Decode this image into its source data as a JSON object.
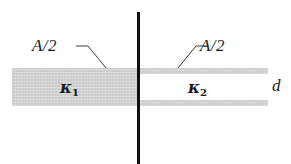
{
  "figure": {
    "labels": {
      "area_left": "A/2",
      "area_right": "A/2",
      "thickness": "d",
      "kappa_left_symbol": "κ",
      "kappa_left_index": "1",
      "kappa_right_symbol": "κ",
      "kappa_right_index": "2"
    },
    "colors": {
      "dielectric_fill": "#d4d4d4",
      "plate_line": "#111111",
      "leader_line": "#3a3a3a",
      "text": "#1b1b1b",
      "background": "#ffffff"
    }
  }
}
